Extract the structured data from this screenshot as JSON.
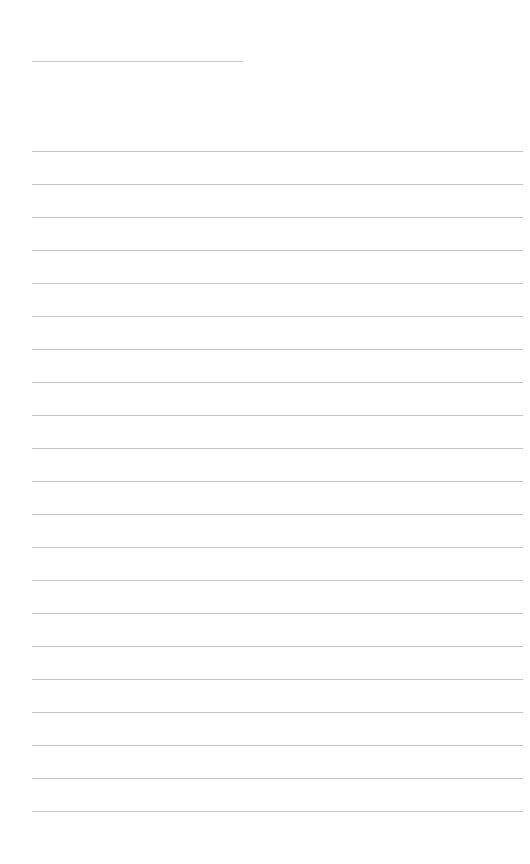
{
  "page": {
    "background": "#ffffff",
    "line_color": "#c4c4c4",
    "title_line": {
      "text": ""
    },
    "ruled_lines": [
      {
        "text": ""
      },
      {
        "text": ""
      },
      {
        "text": ""
      },
      {
        "text": ""
      },
      {
        "text": ""
      },
      {
        "text": ""
      },
      {
        "text": ""
      },
      {
        "text": ""
      },
      {
        "text": ""
      },
      {
        "text": ""
      },
      {
        "text": ""
      },
      {
        "text": ""
      },
      {
        "text": ""
      },
      {
        "text": ""
      },
      {
        "text": ""
      },
      {
        "text": ""
      },
      {
        "text": ""
      },
      {
        "text": ""
      },
      {
        "text": ""
      },
      {
        "text": ""
      },
      {
        "text": ""
      }
    ]
  }
}
